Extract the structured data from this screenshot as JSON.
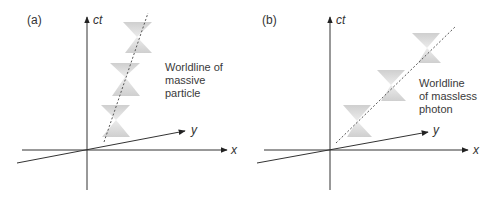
{
  "panels": [
    {
      "id": "a",
      "label": "(a)",
      "axes": {
        "time": "ct",
        "x": "x",
        "y": "y"
      },
      "annotation": [
        "Worldline of",
        "massive",
        "particle"
      ],
      "worldline": "dashed, steep (timelike)",
      "light_cones": 3
    },
    {
      "id": "b",
      "label": "(b)",
      "axes": {
        "time": "ct",
        "x": "x",
        "y": "y"
      },
      "annotation": [
        "Worldline",
        "of massless",
        "photon"
      ],
      "worldline": "dashed, 45-degree (lightlike)",
      "light_cones": 3
    }
  ],
  "colors": {
    "axis": "#333333",
    "cone_fill": "#d6d6d6",
    "worldline": "#555555"
  }
}
